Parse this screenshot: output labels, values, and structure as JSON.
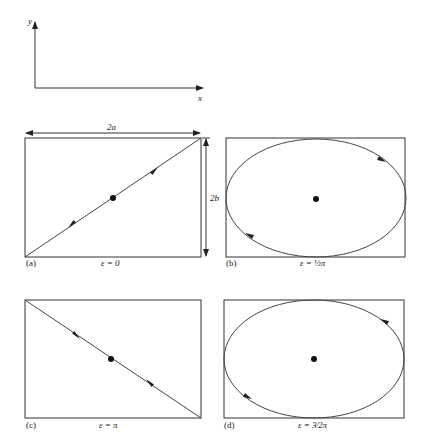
{
  "axes": {
    "y_label": "y",
    "x_label": "x"
  },
  "dimensions": {
    "width_label": "2a",
    "height_label": "2b"
  },
  "panels": [
    {
      "id": "(a)",
      "epsilon_label": "ε = 0",
      "path": "line",
      "direction": "diagonal up-right (bottom-left to top-right)"
    },
    {
      "id": "(b)",
      "epsilon_label": "ε = ½π",
      "path": "ellipse",
      "direction": "clockwise"
    },
    {
      "id": "(c)",
      "epsilon_label": "ε = π",
      "path": "line",
      "direction": "diagonal down-right (top-left to bottom-right)"
    },
    {
      "id": "(d)",
      "epsilon_label": "ε = 3⁄2π",
      "path": "ellipse",
      "direction": "counter-clockwise"
    }
  ],
  "colors": {
    "line": "#333333",
    "background": "#ffffff"
  }
}
